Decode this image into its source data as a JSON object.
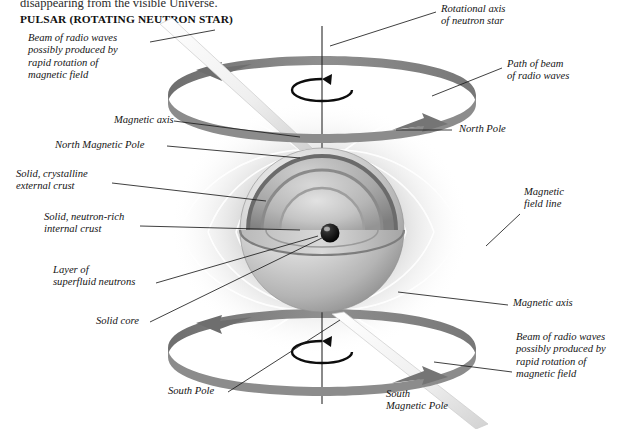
{
  "page": {
    "clipped_body_line": "disappearing from the visible Universe.",
    "title": "PULSAR (ROTATING NEUTRON STAR)",
    "background_color": "#ffffff",
    "ink_color": "#141414"
  },
  "labels": {
    "beam_top": "Beam of radio waves\npossibly produced by\nrapid rotation of\nmagnetic field",
    "rotational_axis": "Rotational axis\nof neutron star",
    "path_of_beam": "Path of beam\nof radio waves",
    "magnetic_axis_top": "Magnetic axis",
    "north_pole": "North Pole",
    "north_magnetic_pole": "North Magnetic Pole",
    "external_crust": "Solid, crystalline\nexternal crust",
    "internal_crust": "Solid, neutron-rich\ninternal crust",
    "superfluid_layer": "Layer of\nsuperfluid neutrons",
    "magnetic_field_line": "Magnetic\nfield line",
    "solid_core": "Solid core",
    "magnetic_axis_bottom": "Magnetic axis",
    "south_pole": "South Pole",
    "south_magnetic_pole": "South\nMagnetic Pole",
    "beam_bottom": "Beam of radio waves\npossibly produced by\nrapid rotation of\nmagnetic field"
  },
  "illustration": {
    "type": "grayscale-cutaway-sphere",
    "subject": "rotating neutron star with magnetic field and radio beams",
    "ring_band_color": "#8c8c8c",
    "ring_band_shadow": "#6f6f6f",
    "core_color": "#151515",
    "field_line_color": "#ffffff",
    "beam_color": "#f2f2f2",
    "leader_line_color": "#1d1d1d",
    "shells": [
      {
        "name": "solid, crystalline external crust"
      },
      {
        "name": "solid, neutron-rich internal crust"
      },
      {
        "name": "layer of superfluid neutrons"
      },
      {
        "name": "solid core"
      }
    ],
    "rings": [
      {
        "name": "north path of beam of radio waves",
        "position": "top"
      },
      {
        "name": "south path of beam of radio waves",
        "position": "bottom"
      }
    ],
    "beams": [
      {
        "name": "north radio beam",
        "direction": "upper-left"
      },
      {
        "name": "south radio beam",
        "direction": "lower-right"
      }
    ],
    "rotation_arrows": 2
  }
}
